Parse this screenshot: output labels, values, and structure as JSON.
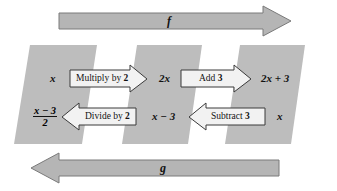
{
  "diagram": {
    "colors": {
      "band_fill": "#bdbdbd",
      "big_arrow_fill": "#b5b5b5",
      "big_arrow_stroke": "#7a7a7a",
      "op_arrow_fill": "#f2f2f2",
      "op_arrow_stroke": "#3a3a3a",
      "text": "#121212",
      "background": "#ffffff"
    },
    "top_arrow": {
      "label": "f",
      "direction": "right",
      "name": "forward-function-arrow"
    },
    "bottom_arrow": {
      "label": "g",
      "direction": "left",
      "name": "inverse-function-arrow"
    },
    "forward_row": {
      "start_value": "x",
      "steps": [
        {
          "label_prefix": "Multiply by ",
          "label_number": "2",
          "direction": "right"
        },
        {
          "label_prefix": "Add ",
          "label_number": "3",
          "direction": "right"
        }
      ],
      "middle_value": "2x",
      "end_value": "2x + 3"
    },
    "inverse_row": {
      "start_value": "x",
      "steps": [
        {
          "label_prefix": "Subtract ",
          "label_number": "3",
          "direction": "left"
        },
        {
          "label_prefix": "Divide by ",
          "label_number": "2",
          "direction": "left"
        }
      ],
      "middle_value": "x − 3",
      "end_fraction_numerator": "x − 3",
      "end_fraction_denominator": "2"
    },
    "bands": [
      {
        "name": "stage-band-left"
      },
      {
        "name": "stage-band-middle"
      },
      {
        "name": "stage-band-right"
      }
    ]
  }
}
